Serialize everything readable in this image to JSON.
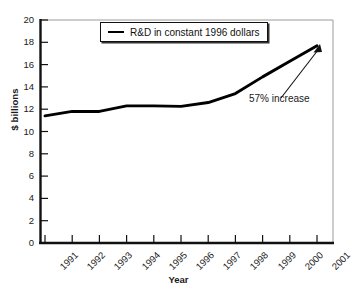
{
  "chart_data": {
    "type": "line",
    "title": "",
    "subtitle": "",
    "xlabel": "Year",
    "ylabel": "$ billions",
    "categories": [
      "1991",
      "1992",
      "1993",
      "1994",
      "1995",
      "1996",
      "1997",
      "1998",
      "1999",
      "2000",
      "2001"
    ],
    "series": [
      {
        "name": "R&D in constant 1996 dollars",
        "values": [
          11.4,
          11.8,
          11.8,
          12.3,
          12.3,
          12.25,
          12.6,
          13.4,
          14.9,
          16.3,
          17.7
        ],
        "color": "#000000"
      }
    ],
    "xlim": [
      1991,
      2001
    ],
    "ylim": [
      0,
      20
    ],
    "yticks": [
      0,
      2,
      4,
      6,
      8,
      10,
      12,
      14,
      16,
      18,
      20
    ],
    "xticks": [
      "1991",
      "1992",
      "1993",
      "1994",
      "1995",
      "1996",
      "1997",
      "1998",
      "1999",
      "2000",
      "2001"
    ],
    "grid": false,
    "legend": {
      "position": "top-center",
      "entries": [
        "R&D in constant 1996 dollars"
      ]
    },
    "annotations": [
      {
        "text": "57% increase",
        "points_to_year": "2001",
        "points_to_value": 17.7
      }
    ]
  },
  "legend": {
    "label": "R&D in constant 1996 dollars"
  },
  "annotation": {
    "text": "57% increase"
  },
  "axes": {
    "x_title": "Year",
    "y_title": "$ billions",
    "y_ticks": [
      "0",
      "2",
      "4",
      "6",
      "8",
      "10",
      "12",
      "14",
      "16",
      "18",
      "20"
    ],
    "x_ticks": [
      "1991",
      "1992",
      "1993",
      "1994",
      "1995",
      "1996",
      "1997",
      "1998",
      "1999",
      "2000",
      "2001"
    ]
  },
  "colors": {
    "line": "#000000",
    "axis": "#111111",
    "frame": "#9a9a9a",
    "background": "#ffffff"
  }
}
